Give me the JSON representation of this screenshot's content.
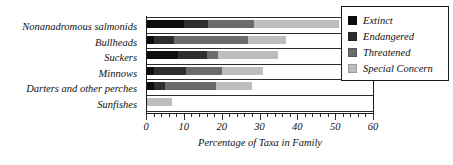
{
  "chart_data": {
    "type": "bar",
    "orientation": "horizontal",
    "stacked": true,
    "title": "",
    "xlabel": "Percentage of Taxa in Family",
    "ylabel": "",
    "xlim": [
      0,
      60
    ],
    "xticks": [
      0,
      10,
      20,
      30,
      40,
      50,
      60
    ],
    "xticklabels": [
      "0",
      "10",
      "20",
      "30",
      "40",
      "50",
      "60"
    ],
    "minor_tick_interval": 2,
    "grid": false,
    "legend_position": "upper right",
    "categories": [
      "Nonanadromous salmonids",
      "Bullheads",
      "Suckers",
      "Minnows",
      "Darters and other perches",
      "Sunfishes"
    ],
    "series": [
      {
        "name": "Extinct",
        "color": "#0d0d0d",
        "values": [
          10.0,
          2.0,
          8.5,
          2.0,
          2.0,
          0.0
        ]
      },
      {
        "name": "Endangered",
        "color": "#2e2e2e",
        "values": [
          6.5,
          5.5,
          7.5,
          8.5,
          3.0,
          0.0
        ]
      },
      {
        "name": "Threatened",
        "color": "#6b6b6b",
        "values": [
          12.0,
          19.5,
          3.0,
          9.5,
          13.5,
          0.0
        ]
      },
      {
        "name": "Special Concern",
        "color": "#bdbdbd",
        "values": [
          22.5,
          10.0,
          16.0,
          11.0,
          9.5,
          7.0
        ]
      }
    ],
    "totals": [
      51.0,
      37.0,
      35.0,
      31.0,
      28.0,
      7.0
    ]
  },
  "legend": {
    "items": [
      {
        "label": "Extinct"
      },
      {
        "label": "Endangered"
      },
      {
        "label": "Threatened"
      },
      {
        "label": "Special Concern"
      }
    ]
  }
}
